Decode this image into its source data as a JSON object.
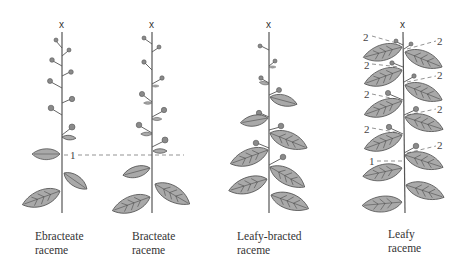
{
  "figure": {
    "type": "botanical-inflorescence-diagram",
    "panels": [
      {
        "id": "ebracteate",
        "caption_line1": "Ebracteate",
        "caption_line2": "raceme",
        "apex_label": "x"
      },
      {
        "id": "bracteate",
        "caption_line1": "Bracteate",
        "caption_line2": "raceme",
        "apex_label": "x"
      },
      {
        "id": "leafy-bracted",
        "caption_line1": "Leafy-bracted",
        "caption_line2": "raceme",
        "apex_label": "x"
      },
      {
        "id": "leafy",
        "caption_line1": "Leafy",
        "caption_line2": "raceme",
        "apex_label": "x"
      }
    ],
    "boundary_marker_label": "1",
    "leafy_bract_marker_label": "2",
    "colors": {
      "leaf_fill": "#a9a9a9",
      "flower_fill": "#8a8a8a",
      "line": "#555555",
      "text": "#333333"
    }
  }
}
